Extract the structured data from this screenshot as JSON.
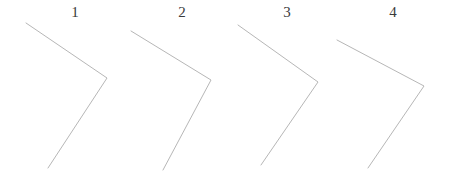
{
  "page": {
    "background_color": "#ffffff",
    "width": 457,
    "height": 174
  },
  "style": {
    "stroke_color": "#aeaeae",
    "stroke_width": 0.9,
    "label_color": "#3a3a3a",
    "label_font_size": 15
  },
  "chart_data": {
    "type": "diagram",
    "title": "",
    "subtitle": "",
    "xlabel": "",
    "ylabel": "",
    "grid": false,
    "legend": null,
    "xlim": [
      0,
      457
    ],
    "ylim": [
      0,
      174
    ],
    "figures": [
      {
        "label": "1",
        "label_x": 75,
        "label_y": 5,
        "vertex": [
          107,
          78
        ],
        "ray_start": [
          26,
          23
        ],
        "ray_end": [
          48,
          168
        ],
        "points": "26,23 107,78 48,168"
      },
      {
        "label": "2",
        "label_x": 182,
        "label_y": 5,
        "vertex": [
          211,
          80
        ],
        "ray_start": [
          131,
          31
        ],
        "ray_end": [
          163,
          170
        ],
        "points": "131,31 211,80 163,170"
      },
      {
        "label": "3",
        "label_x": 287,
        "label_y": 5,
        "vertex": [
          318,
          82
        ],
        "ray_start": [
          238,
          25
        ],
        "ray_end": [
          261,
          165
        ],
        "points": "238,25 318,82 261,165"
      },
      {
        "label": "4",
        "label_x": 393,
        "label_y": 5,
        "vertex": [
          424,
          86
        ],
        "ray_start": [
          337,
          40
        ],
        "ray_end": [
          368,
          168
        ],
        "points": "337,40 424,86 368,168"
      }
    ]
  }
}
